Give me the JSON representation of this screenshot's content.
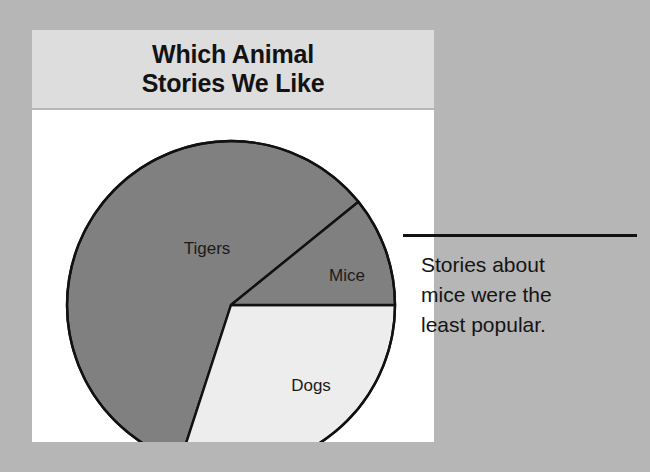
{
  "background_color": "#b6b6b6",
  "card": {
    "banner_color": "#dddddd",
    "panel_color": "#ffffff",
    "title": "Which Animal\nStories We Like"
  },
  "callout": {
    "leader_line_color": "#111111",
    "text": "Stories about\nmice were the\nleast popular."
  },
  "chart_data": {
    "type": "pie",
    "title": "Which Animal Stories We Like",
    "xlabel": "",
    "ylabel": "",
    "legend_position": "none",
    "grid": false,
    "labels_on_slices": true,
    "start_angle_deg": -39,
    "direction": "counterclockwise",
    "categories": [
      "Tigers",
      "Dogs",
      "Mice"
    ],
    "values": [
      59,
      30,
      11
    ],
    "units": "percent",
    "slices": [
      {
        "label": "Tigers",
        "value": 59,
        "angle_deg": 213,
        "color": "#808080",
        "stroke": "#111111",
        "label_x": 175,
        "label_y": 140
      },
      {
        "label": "Dogs",
        "value": 30,
        "angle_deg": 108,
        "color": "#ededed",
        "stroke": "#111111",
        "label_x": 279,
        "label_y": 277
      },
      {
        "label": "Mice",
        "value": 11,
        "angle_deg": 39,
        "color": "#808080",
        "stroke": "#111111",
        "label_x": 315,
        "label_y": 167
      }
    ],
    "annotations": [
      {
        "target": "Mice",
        "text": "Stories about mice were the least popular."
      }
    ]
  }
}
